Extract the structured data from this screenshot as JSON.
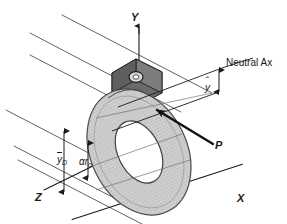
{
  "figure": {
    "type": "engineering-mechanics-diagram",
    "background_color": "#ffffff",
    "line_color": "#1a1a1a",
    "disk_fill_color": "#c9c9c9",
    "disk_edge_color": "#5a5a5a",
    "plate_fill_color": "#6a6a6a",
    "plate_edge_color": "#2a2a2a",
    "hole_fill_color": "#ffffff"
  },
  "axes": {
    "y_label": "Y",
    "x_label": "X",
    "z_label": "Z"
  },
  "annotations": {
    "neutral_axis_label": "Neutral Ax",
    "load_label": "P",
    "y_hat_base": "y",
    "y_hat_accent": "ˆ",
    "y_bar_D_base": "y",
    "y_bar_D_sub": "D",
    "alpha_r_o_base": "αr",
    "alpha_r_o_sub": "o"
  },
  "geometry": {
    "background_lines_count": 6,
    "dimension_arrows": [
      "y-hat",
      "y-bar-D",
      "alpha-r-o"
    ]
  }
}
